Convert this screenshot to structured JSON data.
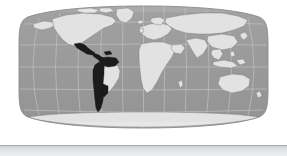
{
  "figure": {
    "kind": "world-map",
    "projection": "robinson",
    "title": "",
    "caption": "",
    "labels": [],
    "annotations": []
  },
  "colors": {
    "page_background": "#ffffff",
    "ocean": "#9a9a9a",
    "ocean_edge": "#8d8d8d",
    "land": "#e2e2e2",
    "land_outline": "#7e7e7e",
    "highlight": "#1b1b1b",
    "highlight_outline": "#111111",
    "graticule": "#c9c9c9",
    "map_border": "#8a8a8a",
    "bottom_bar": "#e6e7ea",
    "bottom_bar_edge": "#a9acb1"
  },
  "map": {
    "frame": {
      "left": 19,
      "top": 6,
      "right": 268,
      "bottom": 128
    },
    "center_longitude": 0,
    "graticule": {
      "visible": true,
      "meridian_interval_degrees": 30,
      "parallel_interval_degrees": 30,
      "meridians": [
        -180,
        -150,
        -120,
        -90,
        -60,
        -30,
        0,
        30,
        60,
        90,
        120,
        150,
        180
      ],
      "parallels": [
        -60,
        -30,
        0,
        30,
        60
      ]
    },
    "highlighted_region": {
      "name": "Latin America",
      "includes": [
        "Mexico",
        "Central America",
        "Caribbean",
        "Colombia",
        "Venezuela",
        "Ecuador",
        "Peru",
        "Bolivia",
        "Chile",
        "Argentina",
        "Paraguay",
        "Uruguay"
      ],
      "excludes": [
        "United States",
        "Canada",
        "Brazil"
      ],
      "fill": "#1b1b1b"
    },
    "unhighlighted_landmasses": [
      "North America",
      "Brazil",
      "Greenland",
      "Europe",
      "Africa",
      "Asia",
      "Australia",
      "Antarctica"
    ]
  },
  "bottom_bar": {
    "visible": true,
    "text": ""
  }
}
